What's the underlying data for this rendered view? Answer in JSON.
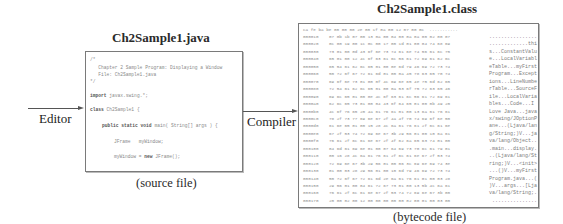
{
  "source": {
    "title": "Ch2Sample1.java",
    "caption": "(source file)",
    "code_lines": [
      "/*",
      "   Chapter 2 Sample Program: Displaying a Window",
      "   File: Ch2Sample1.java",
      "*/",
      "",
      "import javax.swing.*;",
      "",
      "class Ch2Sample1 {",
      "",
      "    public static void main( String[] args ) {",
      "",
      "        JFrame   myWindow;",
      "",
      "        myWindow = new JFrame();"
    ]
  },
  "editor": {
    "label": "Editor"
  },
  "compiler": {
    "label": "Compiler"
  },
  "bytecode": {
    "title": "Ch2Sample1.class",
    "caption": "(bytecode file)",
    "first_row": "ca fe ba be 00 00 00 2e 00 1f 0a 00 12 07 00 0c  ...........",
    "rows": [
      {
        "addr": "000010",
        "hex": "07 0b 1b 07 00 13 0a 00 04 00 0a 0a 00 02 00 07",
        "ascii": "................"
      },
      {
        "addr": "000020",
        "hex": "0c 00 19 00 1c 0c 00 17 00 1d 01 00 04 74 68 69",
        "ascii": ".............thi"
      },
      {
        "addr": "000030",
        "hex": "73 01 00 0d 43 6f 6e 73 74 61 6e 74 56 61 6c 75",
        "ascii": "s...ConstantValu"
      },
      {
        "addr": "000040",
        "hex": "65 01 00 12 4c 6f 63 61 6c 56 61 72 69 61 62 6c",
        "ascii": "e...LocalVariabl"
      },
      {
        "addr": "000050",
        "hex": "65 54 61 62 6c 65 01 00 0e 6d 79 46 69 72 73 74",
        "ascii": "eTable...myFirst"
      },
      {
        "addr": "000060",
        "hex": "50 72 6f 67 72 61 6d 01 00 0a 45 78 63 65 70 74",
        "ascii": "Program...Except"
      },
      {
        "addr": "000070",
        "hex": "69 6f 6e 73 01 00 0f 4c 69 6e 65 4e 75 6d 62 65",
        "ascii": "ions...LineNumbe"
      },
      {
        "addr": "000080",
        "hex": "72 54 61 62 6c 65 01 00 0a 53 6f 75 72 63 65 46",
        "ascii": "rTable...SourceF"
      },
      {
        "addr": "000090",
        "hex": "69 6c 65 01 00 0e 4c 6f 63 61 6c 56 61 72 69 61",
        "ascii": "ile...LocalVaria"
      },
      {
        "addr": "0000a0",
        "hex": "62 6c 65 73 01 00 04 43 6f 64 65 01 00 0b 49 20",
        "ascii": "bles...Code...I "
      },
      {
        "addr": "0000b0",
        "hex": "4c 6f 76 65 20 4a 61 76 61 01 00 13 6a 61 76 61",
        "ascii": "Love Java...java"
      },
      {
        "addr": "0000c0",
        "hex": "78 2f 73 77 69 6e 67 2f 4a 4f 70 74 69 6f 6e 50",
        "ascii": "x/swing/JOptionP"
      },
      {
        "addr": "0000d0",
        "hex": "61 6e 65 01 00 15 28 4c 6a 61 76 61 2f 6c 61 6e",
        "ascii": "ane...(Ljava/lan"
      },
      {
        "addr": "0000e0",
        "hex": "67 2f 53 74 72 69 6e 67 3b 29 56 01 00 10 6a 61",
        "ascii": "g/String;)V...ja"
      },
      {
        "addr": "0000f0",
        "hex": "76 61 2f 6c 61 6e 67 2f 4f 62 6a 65 63 74 01 00",
        "ascii": "va/lang/Object.."
      },
      {
        "addr": "000100",
        "hex": "04 6d 61 69 6e 01 00 07 64 69 73 70 6c 61 79 01",
        "ascii": ".main...display."
      },
      {
        "addr": "000110",
        "hex": "00 16 28 4c 6a 61 76 61 2f 6c 61 6e 67 2f 53 74",
        "ascii": "..(Ljava/lang/St"
      },
      {
        "addr": "000120",
        "hex": "72 69 6e 67 3b 29 56 01 00 06 3c 69 6e 69 74 3e",
        "ascii": "ring;)V...<init>"
      },
      {
        "addr": "000130",
        "hex": "01 00 03 28 29 56 01 00 10 6d 79 46 69 72 73 74",
        "ascii": "...()V...myFirst"
      },
      {
        "addr": "000140",
        "hex": "50 72 6f 67 72 61 6d 2e 6a 61 76 61 01 00 03 28",
        "ascii": "Program.java...("
      },
      {
        "addr": "000150",
        "hex": "29 56 01 00 04 61 72 67 73 01 00 13 5b 4c 6a 61",
        "ascii": ")V...args...[Lja"
      },
      {
        "addr": "000160",
        "hex": "76 61 2f 6c 61 6e 67 2f 53 74 72 69 6e 67 3b 00",
        "ascii": "va/lang/String;."
      },
      {
        "addr": "000170",
        "hex": "20 00 02 00 12 00 00 00 00 00 02 00 01 00 03 00",
        "ascii": " ..............."
      }
    ]
  },
  "colors": {
    "box_border": "#7a7a7a",
    "arrow": "#555555",
    "code_text": "#8a8a8a",
    "title_text": "#2a2a2a"
  }
}
